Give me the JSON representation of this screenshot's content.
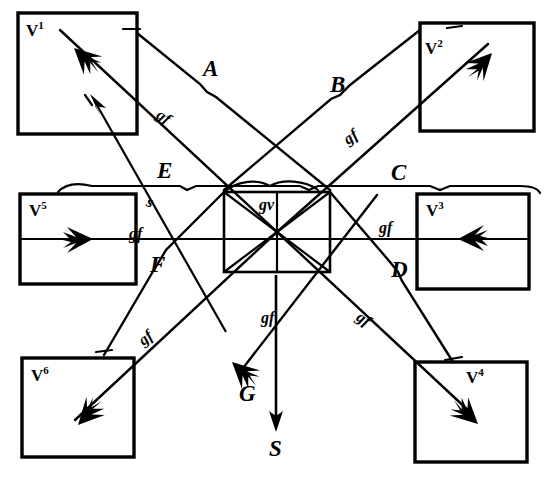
{
  "figure": {
    "background_color": "#ffffff",
    "ink_color": "#000000",
    "canvas": {
      "width": 549,
      "height": 479
    }
  },
  "boxes": [
    {
      "id": "v1",
      "label": "V",
      "sup": "1",
      "x": 18,
      "y": 13,
      "w": 119,
      "h": 121,
      "arrow_dir": "up-left",
      "label_x": 28,
      "label_y": 22
    },
    {
      "id": "v2",
      "label": "V",
      "sup": "2",
      "x": 420,
      "y": 23,
      "w": 114,
      "h": 108,
      "arrow_dir": "up-right",
      "label_x": 427,
      "label_y": 40
    },
    {
      "id": "v5",
      "label": "V",
      "sup": "5",
      "x": 20,
      "y": 194,
      "w": 116,
      "h": 90,
      "arrow_dir": "right",
      "label_x": 30,
      "label_y": 201
    },
    {
      "id": "v3",
      "label": "V",
      "sup": "3",
      "x": 417,
      "y": 194,
      "w": 112,
      "h": 95,
      "arrow_dir": "left",
      "label_x": 427,
      "label_y": 201
    },
    {
      "id": "v6",
      "label": "V",
      "sup": "6",
      "x": 22,
      "y": 358,
      "w": 112,
      "h": 99,
      "arrow_dir": "down-left",
      "label_x": 32,
      "label_y": 366
    },
    {
      "id": "v4",
      "label": "V",
      "sup": "4",
      "x": 415,
      "y": 362,
      "w": 112,
      "h": 100,
      "arrow_dir": "down-right",
      "label_x": 467,
      "label_y": 369
    }
  ],
  "center_square": {
    "x": 224,
    "y": 192,
    "w": 106,
    "h": 80,
    "label": "gv",
    "label_x": 262,
    "label_y": 200
  },
  "segment_labels": [
    {
      "text": "A",
      "x": 204,
      "y": 60
    },
    {
      "text": "B",
      "x": 331,
      "y": 76
    },
    {
      "text": "C",
      "x": 392,
      "y": 164
    },
    {
      "text": "D",
      "x": 392,
      "y": 260
    },
    {
      "text": "E",
      "x": 158,
      "y": 162
    },
    {
      "text": "F",
      "x": 151,
      "y": 255
    },
    {
      "text": "G",
      "x": 240,
      "y": 384
    },
    {
      "text": "S",
      "x": 270,
      "y": 438
    }
  ],
  "gf_labels": [
    {
      "text": "gf",
      "x": 158,
      "y": 111,
      "rot": 35
    },
    {
      "text": "gf",
      "x": 345,
      "y": 131,
      "rot": -35
    },
    {
      "text": "gf",
      "x": 130,
      "y": 228,
      "rot": 0
    },
    {
      "text": "gf",
      "x": 380,
      "y": 222,
      "rot": 0
    },
    {
      "text": "gf",
      "x": 140,
      "y": 332,
      "rot": -38
    },
    {
      "text": "gf",
      "x": 358,
      "y": 313,
      "rot": 34
    },
    {
      "text": "gf",
      "x": 262,
      "y": 312,
      "rot": 0
    },
    {
      "text": "s",
      "x": 148,
      "y": 196,
      "rot": 0
    }
  ],
  "arrow_s": {
    "x": 276,
    "y_top": 275,
    "y_bottom": 432,
    "label": "S"
  }
}
